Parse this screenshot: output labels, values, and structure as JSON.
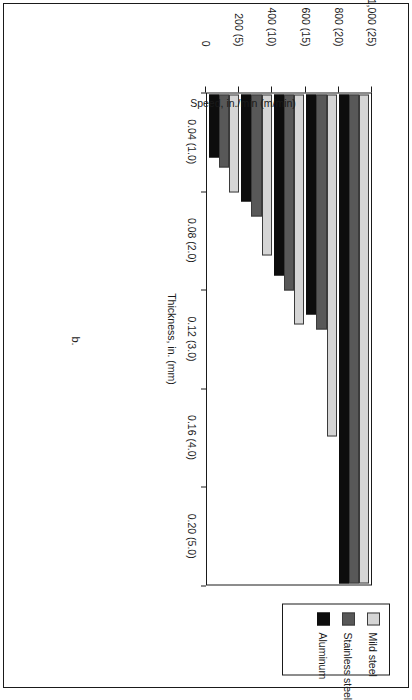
{
  "figure": {
    "caption": "b."
  },
  "chart_data": {
    "type": "bar",
    "orientation": "vertical",
    "title": "Feed rate 4-kW CO2 CW mode",
    "title_parts": {
      "pre": "Feed rate 4-kW CO",
      "sub": "2",
      "post": " CW mode"
    },
    "xlabel": "Thickness, in. (mm)",
    "ylabel": "Speed, in./min (m/min)",
    "categories": [
      "0.04 (1.0)",
      "0.08 (2.0)",
      "0.12 (3.0)",
      "0.16 (4.0)",
      "0.20 (5.0)"
    ],
    "ylim": [
      0,
      1000
    ],
    "yticks": [
      0,
      200,
      400,
      600,
      800,
      1000
    ],
    "ytick_labels": [
      "0",
      "200 (5)",
      "400 (10)",
      "600 (15)",
      "800 (20)",
      "1,000 (25)"
    ],
    "grid": false,
    "legend_position": "top-right",
    "series": [
      {
        "name": "Mild steel",
        "color": "#d5d5d5",
        "values": [
          1000,
          700,
          470,
          330,
          200
        ]
      },
      {
        "name": "Stainless steel",
        "color": "#585858",
        "values": [
          1000,
          480,
          400,
          250,
          150
        ]
      },
      {
        "name": "Aluminum",
        "color": "#0d0d0d",
        "values": [
          1000,
          450,
          370,
          220,
          130
        ]
      }
    ]
  }
}
